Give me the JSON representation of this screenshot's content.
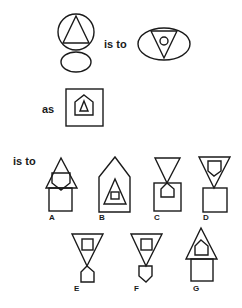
{
  "puzzle": {
    "connector_1": "is to",
    "connector_2": "as",
    "connector_3": "is to",
    "figures": {
      "premise_1": "circle containing upright triangle, above a small ellipse",
      "premise_2": "ellipse containing inverted triangle with small circle inside",
      "premise_3": "square containing pentagon (house shape) with small upright triangle inside"
    },
    "options": [
      {
        "label": "A",
        "description": "upright triangle overlapping a pentagon, above a square"
      },
      {
        "label": "B",
        "description": "tall pentagon containing triangle with small square inside"
      },
      {
        "label": "C",
        "description": "inverted triangle touching a square that contains a pentagon"
      },
      {
        "label": "D",
        "description": "inverted triangle containing inverted pentagon, above a square"
      },
      {
        "label": "E",
        "description": "inverted triangle with square inside, above a pentagon"
      },
      {
        "label": "F",
        "description": "inverted triangle with square inside, above an inverted pentagon"
      },
      {
        "label": "G",
        "description": "upright triangle containing pentagon, above a square"
      }
    ]
  },
  "colors": {
    "stroke": "#1a1a1a",
    "background": "#ffffff"
  }
}
